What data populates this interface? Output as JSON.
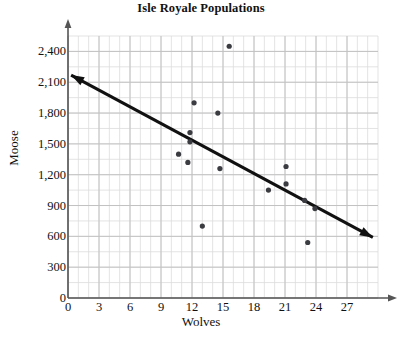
{
  "chart_data": {
    "type": "scatter",
    "title": "Isle Royale Populations",
    "xlabel": "Wolves",
    "ylabel": "Moose",
    "xlim": [
      0,
      30
    ],
    "ylim": [
      0,
      2550
    ],
    "xticks": [
      0,
      3,
      6,
      9,
      12,
      15,
      18,
      21,
      24,
      27
    ],
    "xtick_labels": [
      "0",
      "3",
      "6",
      "9",
      "12",
      "15",
      "18",
      "21",
      "24",
      "27"
    ],
    "yticks": [
      0,
      300,
      600,
      900,
      1200,
      1500,
      1800,
      2100,
      2400
    ],
    "ytick_labels": [
      "0",
      "300",
      "600",
      "900",
      "1,200",
      "1,500",
      "1,800",
      "2,100",
      "2,400"
    ],
    "grid": true,
    "grid_minor_x_step": 1,
    "grid_minor_y_step": 150,
    "legend": "none",
    "point_color": "#3b3b42",
    "line_color": "#111111",
    "grid_color": "#cfcfcf",
    "axis_color": "#555555",
    "points": [
      {
        "x": 15.6,
        "y": 2450
      },
      {
        "x": 12.2,
        "y": 1900
      },
      {
        "x": 14.5,
        "y": 1800
      },
      {
        "x": 11.8,
        "y": 1610
      },
      {
        "x": 11.8,
        "y": 1520
      },
      {
        "x": 10.7,
        "y": 1400
      },
      {
        "x": 11.6,
        "y": 1320
      },
      {
        "x": 14.7,
        "y": 1260
      },
      {
        "x": 21.1,
        "y": 1280
      },
      {
        "x": 21.1,
        "y": 1110
      },
      {
        "x": 19.4,
        "y": 1050
      },
      {
        "x": 22.9,
        "y": 950
      },
      {
        "x": 23.9,
        "y": 870
      },
      {
        "x": 13.0,
        "y": 700
      },
      {
        "x": 23.2,
        "y": 540
      }
    ],
    "trend_line": {
      "label": "trend-line",
      "x_start": 0.3,
      "y_start": 2170,
      "x_end": 29.5,
      "y_end": 590,
      "arrow_start": true,
      "arrow_end": true
    }
  }
}
